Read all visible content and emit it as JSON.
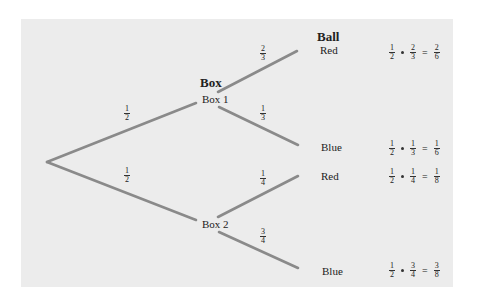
{
  "headers": {
    "box": "Box",
    "ball": "Ball"
  },
  "nodes": {
    "box1": "Box 1",
    "box2": "Box 2"
  },
  "outcomes": [
    {
      "label": "Red",
      "box_prob": {
        "n": "1",
        "d": "2"
      },
      "ball_prob": {
        "n": "2",
        "d": "3"
      },
      "result": {
        "n": "2",
        "d": "6"
      }
    },
    {
      "label": "Blue",
      "box_prob": {
        "n": "1",
        "d": "2"
      },
      "ball_prob": {
        "n": "1",
        "d": "3"
      },
      "result": {
        "n": "1",
        "d": "6"
      }
    },
    {
      "label": "Red",
      "box_prob": {
        "n": "1",
        "d": "2"
      },
      "ball_prob": {
        "n": "1",
        "d": "4"
      },
      "result": {
        "n": "1",
        "d": "8"
      }
    },
    {
      "label": "Blue",
      "box_prob": {
        "n": "1",
        "d": "2"
      },
      "ball_prob": {
        "n": "3",
        "d": "4"
      },
      "result": {
        "n": "3",
        "d": "8"
      }
    }
  ],
  "branch_labels": {
    "root_box1": {
      "n": "1",
      "d": "2"
    },
    "root_box2": {
      "n": "1",
      "d": "2"
    },
    "box1_red": {
      "n": "2",
      "d": "3"
    },
    "box1_blue": {
      "n": "1",
      "d": "3"
    },
    "box2_red": {
      "n": "1",
      "d": "4"
    },
    "box2_blue": {
      "n": "3",
      "d": "4"
    }
  },
  "symbols": {
    "times": "•",
    "equals": "="
  },
  "colors": {
    "panel": "#ececec",
    "branch": "#8a8a8a"
  }
}
